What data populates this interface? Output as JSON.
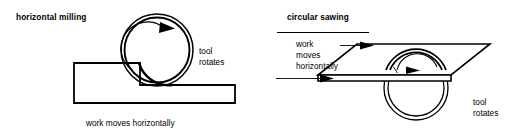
{
  "figure": {
    "background_color": "#ffffff",
    "ink_color": "#000000",
    "width": 514,
    "height": 135
  },
  "panels": [
    {
      "id": "horizontal-milling",
      "title": "horizontal milling",
      "tool_label_line1": "tool",
      "tool_label_line2": "rotates",
      "caption": "work moves horizontally",
      "tool_shape": "double-circle-cutter",
      "rotation_direction": "clockwise",
      "workpiece_shape": "stepped-block"
    },
    {
      "id": "circular-sawing",
      "title": "circular sawing",
      "motion_label_line1": "work",
      "motion_label_line2": "moves",
      "motion_label_line3": "horizontally",
      "tool_label_line1": "tool",
      "tool_label_line2": "rotates",
      "tool_shape": "double-circle-saw-blade",
      "rotation_direction": "clockwise",
      "workpiece_shape": "table-parallelogram",
      "feed_arrows": 2
    }
  ]
}
